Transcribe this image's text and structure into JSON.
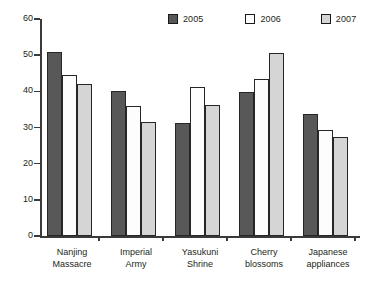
{
  "chart_data": {
    "type": "bar",
    "title": "",
    "subtitle": "",
    "xlabel": "",
    "ylabel": "",
    "ylim": [
      0,
      60
    ],
    "yticks": [
      0,
      10,
      20,
      30,
      40,
      50,
      60
    ],
    "grid": false,
    "legend_position": "top-right",
    "categories": [
      "Nanjing Massacre",
      "Imperial Army",
      "Yasukuni Shrine",
      "Cherry blossoms",
      "Japanese appliances"
    ],
    "category_lines": [
      [
        "Nanjing",
        "Massacre"
      ],
      [
        "Imperial",
        "Army"
      ],
      [
        "Yasukuni",
        "Shrine"
      ],
      [
        "Cherry",
        "blossoms"
      ],
      [
        "Japanese",
        "appliances"
      ]
    ],
    "series": [
      {
        "name": "2005",
        "color": "#585858",
        "values": [
          51.0,
          40.2,
          31.3,
          39.8,
          33.7
        ]
      },
      {
        "name": "2006",
        "color": "#fdfdfd",
        "values": [
          44.5,
          36.0,
          41.2,
          43.4,
          29.3
        ]
      },
      {
        "name": "2007",
        "color": "#d5d5d5",
        "values": [
          42.0,
          31.4,
          36.2,
          50.6,
          27.3
        ]
      }
    ]
  },
  "legend": {
    "items": [
      {
        "label": "2005",
        "color": "#585858"
      },
      {
        "label": "2006",
        "color": "#fdfdfd"
      },
      {
        "label": "2007",
        "color": "#d5d5d5"
      }
    ]
  },
  "axis": {
    "y_tick_labels": [
      "0",
      "10",
      "20",
      "30",
      "40",
      "50",
      "60"
    ]
  }
}
